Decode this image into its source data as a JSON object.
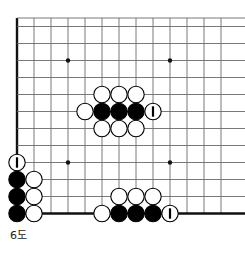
{
  "figure": {
    "caption": "6도"
  },
  "board": {
    "type": "go-board-partial",
    "grid": {
      "origin_x": 17,
      "origin_y": 18,
      "spacing": 17,
      "cols": 13,
      "rows": 12,
      "line_color": "#6b6b6b",
      "edge_color": "#111111",
      "edge_width": 2.4,
      "line_width": 0.9,
      "left_edge": true,
      "bottom_edge": true,
      "top_edge": false,
      "right_edge": false
    },
    "star_points": [
      {
        "col": 3,
        "row": 2.5
      },
      {
        "col": 9,
        "row": 2.5
      },
      {
        "col": 3,
        "row": 8.5
      },
      {
        "col": 9,
        "row": 8.5
      }
    ],
    "star_radius": 2.2,
    "stone_radius": 8.2,
    "colors": {
      "black_stone": "#000000",
      "white_stone": "#ffffff",
      "stone_outline": "#000000",
      "marker": "#000000",
      "background": "#ffffff"
    },
    "stones": [
      {
        "col": 5,
        "row": 4.5,
        "color": "white",
        "mark": ""
      },
      {
        "col": 6,
        "row": 4.5,
        "color": "white",
        "mark": ""
      },
      {
        "col": 7,
        "row": 4.5,
        "color": "white",
        "mark": ""
      },
      {
        "col": 4,
        "row": 5.5,
        "color": "white",
        "mark": ""
      },
      {
        "col": 5,
        "row": 5.5,
        "color": "black",
        "mark": ""
      },
      {
        "col": 6,
        "row": 5.5,
        "color": "black",
        "mark": ""
      },
      {
        "col": 7,
        "row": 5.5,
        "color": "black",
        "mark": ""
      },
      {
        "col": 8,
        "row": 5.5,
        "color": "white",
        "mark": "1"
      },
      {
        "col": 5,
        "row": 6.5,
        "color": "white",
        "mark": ""
      },
      {
        "col": 6,
        "row": 6.5,
        "color": "white",
        "mark": ""
      },
      {
        "col": 7,
        "row": 6.5,
        "color": "white",
        "mark": ""
      },
      {
        "col": 0,
        "row": 8.5,
        "color": "white",
        "mark": "1"
      },
      {
        "col": 0,
        "row": 9.5,
        "color": "black",
        "mark": ""
      },
      {
        "col": 1,
        "row": 9.5,
        "color": "white",
        "mark": ""
      },
      {
        "col": 0,
        "row": 10.5,
        "color": "black",
        "mark": ""
      },
      {
        "col": 1,
        "row": 10.5,
        "color": "white",
        "mark": ""
      },
      {
        "col": 0,
        "row": 11.5,
        "color": "black",
        "mark": ""
      },
      {
        "col": 1,
        "row": 11.5,
        "color": "white",
        "mark": ""
      },
      {
        "col": 6,
        "row": 10.5,
        "color": "white",
        "mark": ""
      },
      {
        "col": 7,
        "row": 10.5,
        "color": "white",
        "mark": ""
      },
      {
        "col": 8,
        "row": 10.5,
        "color": "white",
        "mark": ""
      },
      {
        "col": 5,
        "row": 11.5,
        "color": "white",
        "mark": ""
      },
      {
        "col": 6,
        "row": 11.5,
        "color": "black",
        "mark": ""
      },
      {
        "col": 7,
        "row": 11.5,
        "color": "black",
        "mark": ""
      },
      {
        "col": 8,
        "row": 11.5,
        "color": "black",
        "mark": ""
      },
      {
        "col": 9,
        "row": 11.5,
        "color": "white",
        "mark": "1"
      }
    ]
  }
}
